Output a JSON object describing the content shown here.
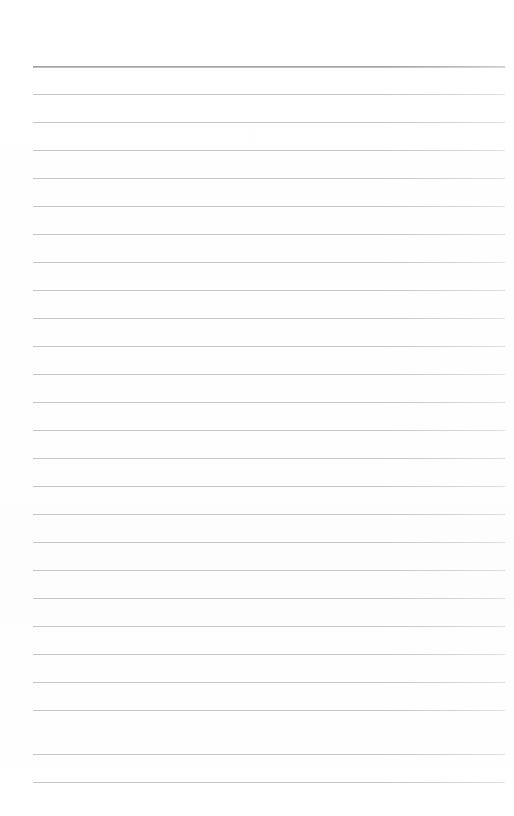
{
  "document": {
    "kind": "lined-notebook-page",
    "title": "Blank ruled page",
    "body_text": "",
    "page_width": 514,
    "page_height": 816,
    "background_color": "#ffffff"
  },
  "rules": {
    "count": 26,
    "first_line_y": 66,
    "line_spacing": 28,
    "left_x": 33,
    "right_x": 505,
    "line_color": "#c2c6c8",
    "header_line_color": "#9b9b9b",
    "header_line_index": 0,
    "header_line_thickness": 2,
    "body_line_thickness": 1,
    "lines": [
      {
        "index": 1,
        "y": 66,
        "emphasis": "heavy"
      },
      {
        "index": 2,
        "y": 94,
        "emphasis": "normal"
      },
      {
        "index": 3,
        "y": 122,
        "emphasis": "normal"
      },
      {
        "index": 4,
        "y": 150,
        "emphasis": "normal"
      },
      {
        "index": 5,
        "y": 178,
        "emphasis": "normal"
      },
      {
        "index": 6,
        "y": 206,
        "emphasis": "normal"
      },
      {
        "index": 7,
        "y": 234,
        "emphasis": "normal"
      },
      {
        "index": 8,
        "y": 262,
        "emphasis": "normal"
      },
      {
        "index": 9,
        "y": 290,
        "emphasis": "normal"
      },
      {
        "index": 10,
        "y": 318,
        "emphasis": "normal"
      },
      {
        "index": 11,
        "y": 346,
        "emphasis": "normal"
      },
      {
        "index": 12,
        "y": 374,
        "emphasis": "normal"
      },
      {
        "index": 13,
        "y": 402,
        "emphasis": "normal"
      },
      {
        "index": 14,
        "y": 430,
        "emphasis": "normal"
      },
      {
        "index": 15,
        "y": 458,
        "emphasis": "normal"
      },
      {
        "index": 16,
        "y": 486,
        "emphasis": "normal"
      },
      {
        "index": 17,
        "y": 514,
        "emphasis": "normal"
      },
      {
        "index": 18,
        "y": 542,
        "emphasis": "normal"
      },
      {
        "index": 19,
        "y": 570,
        "emphasis": "normal"
      },
      {
        "index": 20,
        "y": 598,
        "emphasis": "normal"
      },
      {
        "index": 21,
        "y": 626,
        "emphasis": "normal"
      },
      {
        "index": 22,
        "y": 654,
        "emphasis": "normal"
      },
      {
        "index": 23,
        "y": 682,
        "emphasis": "normal"
      },
      {
        "index": 24,
        "y": 710,
        "emphasis": "normal"
      },
      {
        "index": 25,
        "y": 754,
        "emphasis": "normal"
      },
      {
        "index": 26,
        "y": 782,
        "emphasis": "normal"
      }
    ]
  }
}
